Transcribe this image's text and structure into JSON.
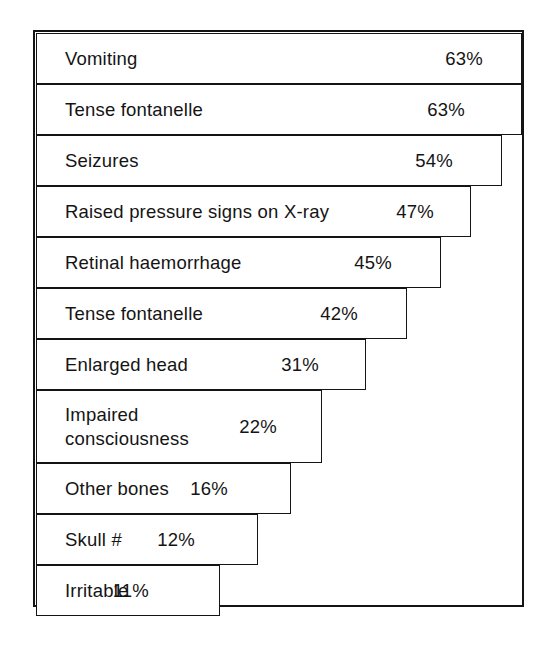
{
  "figure": {
    "type": "stepped-horizontal-bar-chart",
    "frame": {
      "visible": true,
      "color": "#141414"
    },
    "background_color": "#ffffff",
    "bar_fill_color": "#ffffff",
    "bar_stroke_color": "#141414"
  },
  "chart_data": {
    "type": "bar",
    "orientation": "horizontal",
    "title": "",
    "subtitle": "",
    "xlabel": "",
    "ylabel": "",
    "xlim": [
      0,
      63
    ],
    "grid": false,
    "legend": null,
    "value_suffix": "%",
    "categories": [
      "Vomiting",
      "Tense fontanelle",
      "Seizures",
      "Raised pressure signs on X-ray",
      "Retinal haemorrhage",
      "Tense fontanelle",
      "Enlarged  head",
      "Impaired\nconsciousness",
      "Other bones",
      "Skull #",
      "Irritable"
    ],
    "values": [
      63,
      63,
      54,
      47,
      45,
      42,
      31,
      22,
      16,
      12,
      11
    ],
    "value_labels": [
      "63%",
      "63%",
      "54%",
      "47%",
      "45%",
      "42%",
      "31%",
      "22%",
      "16%",
      "12%",
      "11%"
    ]
  },
  "rows": [
    {
      "label": "Vomiting",
      "value_label": "63%",
      "value": 63
    },
    {
      "label": "Tense fontanelle",
      "value_label": "63%",
      "value": 63
    },
    {
      "label": "Seizures",
      "value_label": "54%",
      "value": 54
    },
    {
      "label": "Raised pressure signs on X-ray",
      "value_label": "47%",
      "value": 47
    },
    {
      "label": "Retinal haemorrhage",
      "value_label": "45%",
      "value": 45
    },
    {
      "label": "Tense fontanelle",
      "value_label": "42%",
      "value": 42
    },
    {
      "label": "Enlarged  head",
      "value_label": "31%",
      "value": 31
    },
    {
      "label": "Impaired\nconsciousness",
      "value_label": "22%",
      "value": 22
    },
    {
      "label": "Other bones",
      "value_label": "16%",
      "value": 16
    },
    {
      "label": "Skull #",
      "value_label": "12%",
      "value": 12
    },
    {
      "label": "Irritable",
      "value_label": "11%",
      "value": 11
    }
  ],
  "layout": {
    "row_geometry": [
      {
        "top": 3,
        "height": 51,
        "width": 486,
        "value_right": 38
      },
      {
        "top": 54,
        "height": 51,
        "width": 486,
        "value_right": 56
      },
      {
        "top": 105,
        "height": 51,
        "width": 466,
        "value_right": 48
      },
      {
        "top": 156,
        "height": 51,
        "width": 435,
        "value_right": 36
      },
      {
        "top": 207,
        "height": 51,
        "width": 405,
        "value_right": 48
      },
      {
        "top": 258,
        "height": 51,
        "width": 371,
        "value_right": 48
      },
      {
        "top": 309,
        "height": 51,
        "width": 330,
        "value_right": 46
      },
      {
        "top": 360,
        "height": 73,
        "width": 286,
        "value_right": 44
      },
      {
        "top": 433,
        "height": 51,
        "width": 255,
        "value_right": 62
      },
      {
        "top": 484,
        "height": 51,
        "width": 222,
        "value_right": 62
      },
      {
        "top": 535,
        "height": 51,
        "width": 184,
        "value_right": 70
      }
    ]
  }
}
